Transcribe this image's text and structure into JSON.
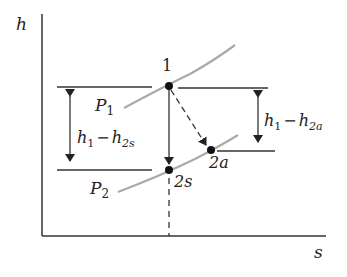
{
  "diagram": {
    "title": "",
    "axes": {
      "y_label": "h",
      "x_label": "s"
    },
    "isobars": [
      {
        "name": "P1",
        "label_main": "P",
        "label_sub": "1"
      },
      {
        "name": "P2",
        "label_main": "P",
        "label_sub": "2"
      }
    ],
    "states": [
      {
        "id": "1",
        "label": "1"
      },
      {
        "id": "2s",
        "label": "2s"
      },
      {
        "id": "2a",
        "label": "2a"
      }
    ],
    "dimensions": {
      "isentropic": {
        "h1": "h",
        "sub1": "1",
        "minus": "−",
        "h2": "h",
        "sub2": "2s"
      },
      "actual": {
        "h1": "h",
        "sub1": "1",
        "minus": "−",
        "h2": "h",
        "sub2": "2a"
      }
    },
    "colors": {
      "line": "#222222",
      "isobar": "#a8a8a8"
    }
  }
}
